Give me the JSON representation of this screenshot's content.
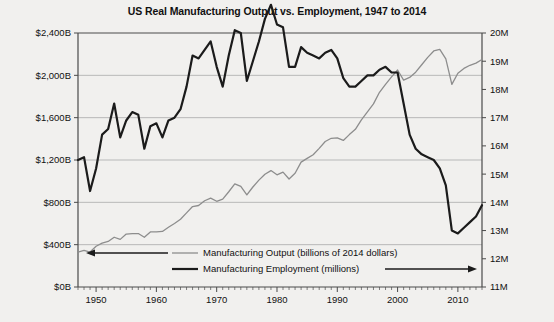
{
  "chart_data": {
    "type": "line",
    "title": "US Real Manufacturing Output vs. Employment, 1947 to 2014",
    "xlabel": "",
    "ylabel": "",
    "grid": true,
    "legend_position": "inside-bottom-center",
    "x": [
      1947,
      1948,
      1949,
      1950,
      1951,
      1952,
      1953,
      1954,
      1955,
      1956,
      1957,
      1958,
      1959,
      1960,
      1961,
      1962,
      1963,
      1964,
      1965,
      1966,
      1967,
      1968,
      1969,
      1970,
      1971,
      1972,
      1973,
      1974,
      1975,
      1976,
      1977,
      1978,
      1979,
      1980,
      1981,
      1982,
      1983,
      1984,
      1985,
      1986,
      1987,
      1988,
      1989,
      1990,
      1991,
      1992,
      1993,
      1994,
      1995,
      1996,
      1997,
      1998,
      1999,
      2000,
      2001,
      2002,
      2003,
      2004,
      2005,
      2006,
      2007,
      2008,
      2009,
      2010,
      2011,
      2012,
      2013,
      2014
    ],
    "axes": {
      "x": {
        "min": 1947,
        "max": 2014,
        "major_ticks": [
          1950,
          1960,
          1970,
          1980,
          1990,
          2000,
          2010
        ],
        "tick_labels": [
          "1950",
          "1960",
          "1970",
          "1980",
          "1990",
          "2000",
          "2010"
        ],
        "minor_tick_interval": 1
      },
      "y_left": {
        "min": 0,
        "max": 2400,
        "unit": "billions of 2014 dollars",
        "tick_labels": [
          "$0B",
          "$400B",
          "$800B",
          "$1,200B",
          "$1,600B",
          "$2,000B",
          "$2,400B"
        ],
        "tick_values": [
          0,
          400,
          800,
          1200,
          1600,
          2000,
          2400
        ]
      },
      "y_right": {
        "min": 11,
        "max": 20,
        "unit": "millions",
        "tick_labels": [
          "11M",
          "12M",
          "13M",
          "14M",
          "15M",
          "16M",
          "17M",
          "18M",
          "19M",
          "20M"
        ],
        "tick_values": [
          11,
          12,
          13,
          14,
          15,
          16,
          17,
          18,
          19,
          20
        ]
      }
    },
    "series": [
      {
        "name": "Manufacturing Output (billions of 2014 dollars)",
        "axis": "left",
        "color": "#8d8d8d",
        "width": 1.3,
        "values": [
          330,
          345,
          330,
          385,
          415,
          430,
          470,
          450,
          500,
          505,
          505,
          470,
          520,
          520,
          525,
          565,
          600,
          640,
          700,
          760,
          770,
          815,
          840,
          810,
          830,
          900,
          975,
          950,
          870,
          945,
          1010,
          1065,
          1100,
          1060,
          1085,
          1020,
          1075,
          1180,
          1215,
          1250,
          1310,
          1375,
          1405,
          1410,
          1385,
          1440,
          1490,
          1580,
          1655,
          1730,
          1840,
          1915,
          1985,
          2050,
          1955,
          1980,
          2030,
          2100,
          2170,
          2230,
          2245,
          2155,
          1915,
          2020,
          2065,
          2095,
          2115,
          2150
        ]
      },
      {
        "name": "Manufacturing Employment (millions)",
        "axis": "right",
        "color": "#1b1b1b",
        "width": 2.2,
        "values": [
          15.5,
          15.6,
          14.4,
          15.2,
          16.4,
          16.6,
          17.5,
          16.3,
          16.9,
          17.2,
          17.1,
          15.9,
          16.7,
          16.8,
          16.3,
          16.9,
          17.0,
          17.3,
          18.1,
          19.2,
          19.1,
          19.4,
          19.7,
          18.8,
          18.1,
          19.2,
          20.1,
          20.0,
          18.3,
          19.0,
          19.7,
          20.5,
          21.0,
          20.3,
          20.2,
          18.8,
          18.8,
          19.5,
          19.3,
          19.2,
          19.1,
          19.3,
          19.4,
          19.1,
          18.4,
          18.1,
          18.1,
          18.3,
          18.5,
          18.5,
          18.7,
          18.8,
          18.6,
          18.6,
          17.5,
          16.4,
          15.9,
          15.7,
          15.6,
          15.5,
          15.2,
          14.6,
          13.0,
          12.9,
          13.1,
          13.3,
          13.5,
          13.9
        ]
      }
    ],
    "annotations": [
      {
        "name": "output-arrow-left",
        "points_to": "left-axis"
      },
      {
        "name": "employment-arrow-right",
        "points_to": "right-axis"
      }
    ]
  },
  "legend": {
    "entries": [
      {
        "label": "Manufacturing Output (billions of 2014 dollars)"
      },
      {
        "label": "Manufacturing Employment (millions)"
      }
    ]
  }
}
